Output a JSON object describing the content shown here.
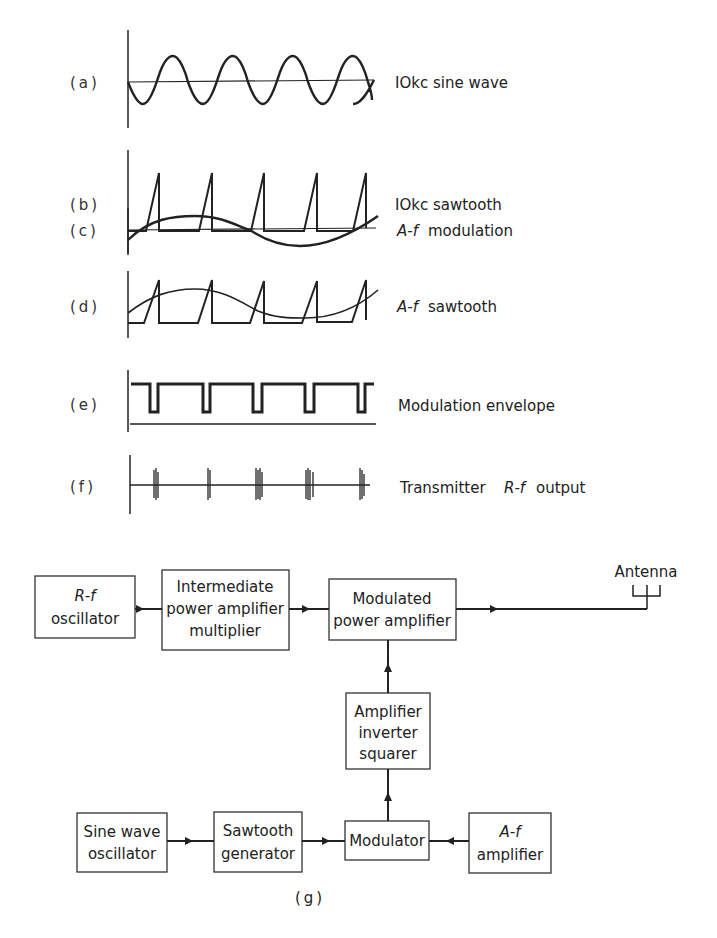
{
  "waveforms": [
    {
      "tag": "(a)",
      "label": "IOkc sine wave",
      "label_italic": "",
      "label_rest": ""
    },
    {
      "tag": "(b)",
      "label": "IOkc sawtooth",
      "label_italic": "",
      "label_rest": ""
    },
    {
      "tag": "(c)",
      "label": "",
      "label_italic": "A-f",
      "label_rest": " modulation"
    },
    {
      "tag": "(d)",
      "label": "",
      "label_italic": "A-f",
      "label_rest": " sawtooth"
    },
    {
      "tag": "(e)",
      "label": "Modulation envelope",
      "label_italic": "",
      "label_rest": ""
    },
    {
      "tag": "(f)",
      "label": "Transmitter ",
      "label_italic": "R-f",
      "label_rest": " output"
    }
  ],
  "block_diagram": {
    "caption": "(g)",
    "antenna_label": "Antenna",
    "blocks": {
      "rf_oscillator": {
        "line1_italic": "R-f",
        "line2": "oscillator"
      },
      "ipa": {
        "line1": "Intermediate",
        "line2": "power amplifier",
        "line3": "multiplier"
      },
      "mpa": {
        "line1": "Modulated",
        "line2": "power amplifier"
      },
      "ais": {
        "line1": "Amplifier",
        "line2": "inverter",
        "line3": "squarer"
      },
      "sine_osc": {
        "line1": "Sine wave",
        "line2": "oscillator"
      },
      "sawtooth_gen": {
        "line1": "Sawtooth",
        "line2": "generator"
      },
      "modulator": {
        "line1": "Modulator"
      },
      "af_amp": {
        "line1_italic": "A-f",
        "line2": "amplifier"
      }
    }
  }
}
